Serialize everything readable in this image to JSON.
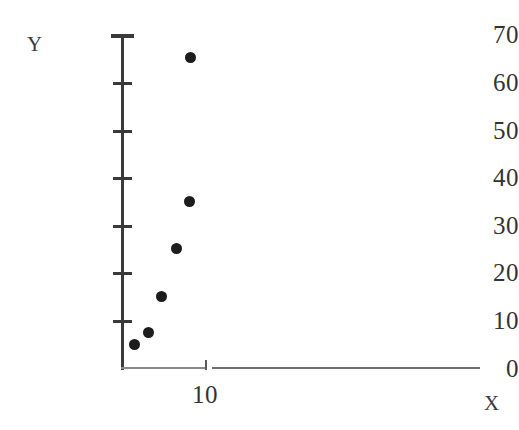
{
  "chart_data": {
    "type": "scatter",
    "title": "",
    "xlabel": "X",
    "ylabel": "Y",
    "xlim": [
      0,
      43
    ],
    "ylim": [
      0,
      70
    ],
    "grid": false,
    "legend": null,
    "x_ticks": [
      {
        "value": 10,
        "label": "10"
      }
    ],
    "y_ticks": [
      {
        "value": 70,
        "label": "70"
      },
      {
        "value": 60,
        "label": "60"
      },
      {
        "value": 50,
        "label": "50"
      },
      {
        "value": 40,
        "label": "40"
      },
      {
        "value": 30,
        "label": "30"
      },
      {
        "value": 20,
        "label": "20"
      },
      {
        "value": 10,
        "label": "10"
      },
      {
        "value": 0,
        "label": "0"
      }
    ],
    "series": [
      {
        "name": "points",
        "marker": "filled-circle",
        "color": "#1c1c1c",
        "points": [
          {
            "x": 1.5,
            "y": 5
          },
          {
            "x": 3.1,
            "y": 7.5
          },
          {
            "x": 4.7,
            "y": 15
          },
          {
            "x": 6.6,
            "y": 25
          },
          {
            "x": 8.1,
            "y": 35
          },
          {
            "x": 8.3,
            "y": 65
          }
        ]
      }
    ],
    "x": [
      1.5,
      3.1,
      4.7,
      6.6,
      8.1,
      8.3
    ],
    "y": [
      5,
      7.5,
      15,
      25,
      35,
      65
    ],
    "colors": {
      "marker": "#1c1c1c",
      "axis": "#3a3a3a",
      "x_axis_tail": "#6e6e6e",
      "text": "#333333",
      "background": "#ffffff"
    }
  }
}
